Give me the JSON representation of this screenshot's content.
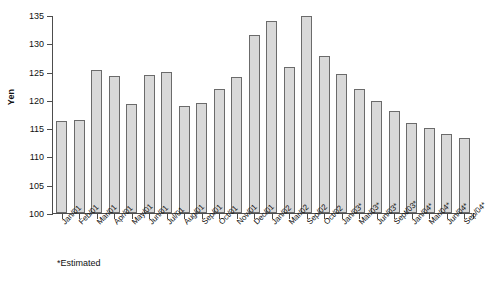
{
  "chart_data": {
    "type": "bar",
    "title": "",
    "subtitle": "",
    "xlabel": "",
    "ylabel": "Yen",
    "ylim": [
      100,
      135
    ],
    "ytick_step": 5,
    "yticks": [
      100,
      105,
      110,
      115,
      120,
      125,
      130,
      135
    ],
    "grid": false,
    "legend": false,
    "legend_position": "none",
    "footnote": "*Estimated",
    "bar_fill_color": "#d9d9d9",
    "bar_border_color": "#6b6b6b",
    "axis_color": "#4d4d4d",
    "categories": [
      "Jan/01",
      "Feb/01",
      "Mar/01",
      "Apr/01",
      "May/01",
      "Jun/01",
      "Jul/01",
      "Aug/01",
      "Sep/01",
      "Oct/01",
      "Nov/01",
      "Dec/01",
      "Jan/02",
      "Mar/02",
      "Sep/02",
      "Oct/02",
      "Jan/03*",
      "Mar/03*",
      "Jun/03*",
      "Sept/03*",
      "Jan/04*",
      "Mar/04*",
      "Jun/04*",
      "Sep/04*"
    ],
    "values": [
      116.3,
      116.5,
      125.3,
      124.2,
      119.2,
      124.4,
      125.0,
      119.0,
      119.4,
      121.9,
      124.1,
      131.4,
      134.0,
      125.8,
      134.8,
      127.8,
      124.6,
      122.0,
      119.8,
      118.0,
      116.0,
      115.0,
      114.0,
      113.2
    ]
  },
  "axis_title": {
    "y": "Yen"
  }
}
